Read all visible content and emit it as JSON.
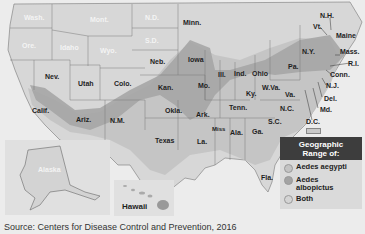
{
  "map": {
    "title": "Geographic Range of Aedes mosquitoes (United States)",
    "colors": {
      "background": "#ececec",
      "state_fill": "#d7d7d7",
      "state_border": "#777777",
      "aedes_aegypti": "#c3c3c3",
      "aedes_albopictus": "#a3a3a3",
      "both": "#c9c9c9",
      "legend_header": "#3d3d3d"
    },
    "state_labels": {
      "wash": "Wash.",
      "ore": "Ore.",
      "idaho": "Idaho",
      "mont": "Mont.",
      "wyo": "Wyo.",
      "nd": "N.D.",
      "sd": "S.D.",
      "nev": "Nev.",
      "utah": "Utah",
      "colo": "Colo.",
      "calif": "Calif.",
      "ariz": "Ariz.",
      "nm": "N.M.",
      "neb": "Neb.",
      "kan": "Kan.",
      "okla": "Okla.",
      "texas": "Texas",
      "minn": "Minn.",
      "iowa": "Iowa",
      "mo": "Mo.",
      "ark": "Ark.",
      "la": "La.",
      "ill": "Ill.",
      "ind": "Ind.",
      "ohio": "Ohio",
      "ky": "Ky.",
      "tenn": "Tenn.",
      "miss": "Miss",
      "ala": "Ala.",
      "ga": "Ga.",
      "fla": "Fla.",
      "sc": "S.C.",
      "nc": "N.C.",
      "va": "Va.",
      "wva": "W.Va.",
      "pa": "Pa.",
      "ny": "N.Y.",
      "vt": "Vt.",
      "nh": "N.H.",
      "maine": "Maine",
      "mass": "Mass.",
      "ri": "R.I.",
      "conn": "Conn.",
      "nj": "N.J.",
      "del": "Del.",
      "md": "Md.",
      "dc": "D.C.",
      "alaska": "Alaska",
      "hawaii": "Hawaii"
    }
  },
  "legend": {
    "title_line1": "Geographic",
    "title_line2": "Range of:",
    "items": [
      {
        "label": "Aedes aegypti",
        "color": "#c3c3c3"
      },
      {
        "label_line1": "Aedes",
        "label_line2": "albopictus",
        "color": "#a3a3a3"
      },
      {
        "label": "Both",
        "color": "#d4d4d4"
      }
    ]
  },
  "source": "Source: Centers for Disease Control and Prevention, 2016"
}
